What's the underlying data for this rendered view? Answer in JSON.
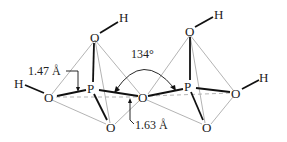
{
  "diagram": {
    "atoms": {
      "left_top_O": "O",
      "left_top_H": "H",
      "left_P": "P",
      "left_O": "O",
      "left_H": "H",
      "left_bottom_O": "O",
      "bridge_O": "O",
      "right_top_O": "O",
      "right_top_H": "H",
      "right_P": "P",
      "right_O": "O",
      "right_H": "H",
      "right_bottom_O": "O"
    },
    "annotations": {
      "terminal_bond_length": "1.47 Å",
      "bridging_bond_length": "1.63 Å",
      "bridge_angle": "134°"
    },
    "colors": {
      "bond": "#111111",
      "tetrahedron_edge": "#aaaaaa",
      "hidden_edge": "#aaaaaa"
    }
  }
}
